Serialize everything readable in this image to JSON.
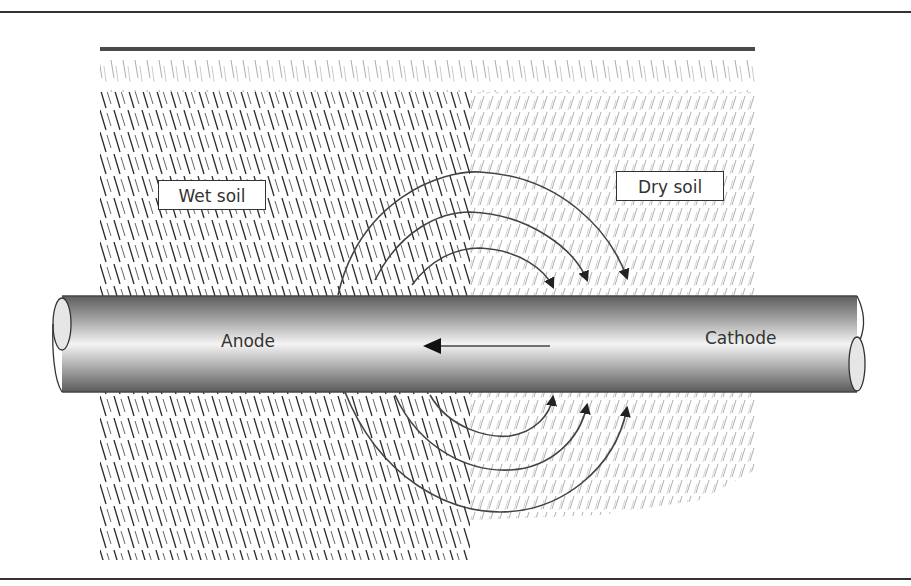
{
  "diagram": {
    "labels": {
      "wet_soil": "Wet soil",
      "dry_soil": "Dry soil",
      "anode": "Anode",
      "cathode": "Cathode"
    },
    "colors": {
      "frame": "#333333",
      "pipe_dark": "#6a6a6a",
      "pipe_light": "#f2f2f2",
      "wet_hatch": "#2a2a2a",
      "dry_hatch": "#8a8a8a",
      "arrow": "#444444"
    },
    "regions": [
      {
        "name": "wet-soil",
        "hatch": "backslash-dense"
      },
      {
        "name": "dry-soil",
        "hatch": "forward-slash-light"
      }
    ],
    "arrows": {
      "internal_current": "right-to-left inside pipe",
      "upper_arcs": 3,
      "lower_arcs": 3
    }
  }
}
